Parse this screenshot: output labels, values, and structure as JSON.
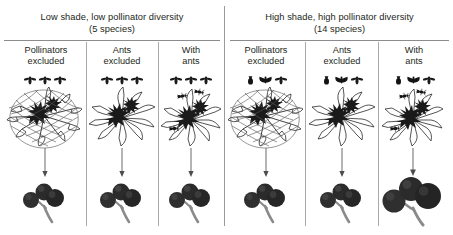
{
  "figure": {
    "title_visible": false,
    "colors": {
      "ink": "#231f20",
      "rule": "#8b8b8d",
      "divider": "#a9a9ab",
      "fruit_dark": "#2b2b2b",
      "fruit_mid": "#4a4a4a",
      "stem": "#7b7b7b",
      "mesh": "#5a5a5a",
      "background": "#ffffff"
    }
  },
  "groups": [
    {
      "id": "low-shade",
      "line1": "Low shade, low pollinator diversity",
      "line2": "(5 species)",
      "species_count": 5,
      "pollinator_icon_set": "uniform",
      "columns": [
        {
          "id": "pollinators-excluded",
          "line1": "Pollinators",
          "line2": "excluded",
          "treatment": "pollinators-excluded",
          "has_mesh_bag": true,
          "ants_on_flower": 0,
          "pollinator_icons": [
            "bee-icon",
            "bee-icon",
            "bee-icon"
          ],
          "fruit_count": 3,
          "fruit_size": "small"
        },
        {
          "id": "ants-excluded",
          "line1": "Ants",
          "line2": "excluded",
          "treatment": "ants-excluded",
          "has_mesh_bag": false,
          "ants_on_flower": 0,
          "pollinator_icons": [
            "bee-icon",
            "bee-icon",
            "bee-icon"
          ],
          "fruit_count": 3,
          "fruit_size": "small"
        },
        {
          "id": "with-ants",
          "line1": "With",
          "line2": "ants",
          "treatment": "with-ants",
          "has_mesh_bag": false,
          "ants_on_flower": 3,
          "pollinator_icons": [
            "bee-icon",
            "bee-icon",
            "bee-icon"
          ],
          "fruit_count": 3,
          "fruit_size": "small"
        }
      ]
    },
    {
      "id": "high-shade",
      "line1": "High shade, high pollinator diversity",
      "line2": "(14 species)",
      "species_count": 14,
      "pollinator_icon_set": "varied",
      "columns": [
        {
          "id": "pollinators-excluded",
          "line1": "Pollinators",
          "line2": "excluded",
          "treatment": "pollinators-excluded",
          "has_mesh_bag": true,
          "ants_on_flower": 0,
          "pollinator_icons": [
            "beetle-icon",
            "moth-icon",
            "bee-icon"
          ],
          "fruit_count": 3,
          "fruit_size": "small"
        },
        {
          "id": "ants-excluded",
          "line1": "Ants",
          "line2": "excluded",
          "treatment": "ants-excluded",
          "has_mesh_bag": false,
          "ants_on_flower": 0,
          "pollinator_icons": [
            "beetle-icon",
            "moth-icon",
            "bee-icon"
          ],
          "fruit_count": 3,
          "fruit_size": "small"
        },
        {
          "id": "with-ants",
          "line1": "With",
          "line2": "ants",
          "treatment": "with-ants",
          "has_mesh_bag": false,
          "ants_on_flower": 3,
          "pollinator_icons": [
            "beetle-icon",
            "moth-icon",
            "bee-icon"
          ],
          "fruit_count": 3,
          "fruit_size": "large"
        }
      ]
    }
  ]
}
